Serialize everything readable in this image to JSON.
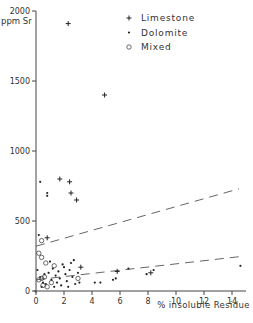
{
  "chart_data": {
    "type": "scatter",
    "title": "",
    "xlabel": "% insoluble Residue",
    "ylabel": "ppm Sr",
    "xlim": [
      0,
      15
    ],
    "ylim": [
      0,
      2000
    ],
    "x_ticks": [
      0,
      2,
      4,
      6,
      8,
      10,
      12,
      14
    ],
    "y_ticks": [
      0,
      500,
      1000,
      1500,
      2000
    ],
    "x_tick_labels": [
      "0",
      "2",
      "4",
      "6",
      "8",
      "10",
      "12",
      "14"
    ],
    "y_tick_labels": [
      "0",
      "500",
      "1000",
      "1500",
      "2000"
    ],
    "grid": false,
    "legend_position": "upper right",
    "legend": [
      "Limestone",
      "Dolomite",
      "Mixed"
    ],
    "series": [
      {
        "name": "Limestone",
        "marker": "plus",
        "points": [
          [
            2.3,
            1910
          ],
          [
            4.9,
            1400
          ],
          [
            1.7,
            800
          ],
          [
            2.4,
            780
          ],
          [
            2.5,
            700
          ],
          [
            2.9,
            650
          ],
          [
            0.8,
            380
          ],
          [
            5.8,
            140
          ],
          [
            8.2,
            130
          ],
          [
            3.2,
            170
          ]
        ]
      },
      {
        "name": "Dolomite",
        "marker": "dot",
        "points": [
          [
            0.3,
            780
          ],
          [
            0.8,
            700
          ],
          [
            0.8,
            680
          ],
          [
            0.2,
            400
          ],
          [
            0.1,
            150
          ],
          [
            0.3,
            100
          ],
          [
            0.5,
            60
          ],
          [
            0.7,
            50
          ],
          [
            0.9,
            130
          ],
          [
            1.1,
            80
          ],
          [
            1.2,
            160
          ],
          [
            1.4,
            110
          ],
          [
            1.5,
            60
          ],
          [
            1.6,
            140
          ],
          [
            1.7,
            90
          ],
          [
            1.8,
            40
          ],
          [
            2.0,
            170
          ],
          [
            2.1,
            120
          ],
          [
            2.2,
            70
          ],
          [
            2.4,
            150
          ],
          [
            2.5,
            200
          ],
          [
            2.6,
            100
          ],
          [
            2.8,
            50
          ],
          [
            3.0,
            130
          ],
          [
            3.1,
            60
          ],
          [
            1.0,
            210
          ],
          [
            1.3,
            30
          ],
          [
            2.3,
            30
          ],
          [
            4.2,
            60
          ],
          [
            4.6,
            60
          ],
          [
            5.5,
            80
          ],
          [
            5.7,
            90
          ],
          [
            6.6,
            160
          ],
          [
            7.9,
            120
          ],
          [
            8.4,
            150
          ],
          [
            14.6,
            180
          ],
          [
            0.4,
            30
          ],
          [
            0.6,
            120
          ],
          [
            1.9,
            190
          ],
          [
            2.7,
            220
          ]
        ]
      },
      {
        "name": "Mixed",
        "marker": "circle",
        "points": [
          [
            0.4,
            360
          ],
          [
            0.2,
            270
          ],
          [
            0.4,
            240
          ],
          [
            0.7,
            200
          ],
          [
            1.3,
            180
          ],
          [
            0.2,
            80
          ],
          [
            0.4,
            90
          ],
          [
            0.6,
            100
          ],
          [
            0.5,
            40
          ],
          [
            0.8,
            30
          ],
          [
            3.0,
            90
          ],
          [
            1.1,
            60
          ]
        ]
      }
    ],
    "trend_lines": [
      {
        "style": "dashed",
        "from": [
          0,
          320
        ],
        "to": [
          14.5,
          730
        ]
      },
      {
        "style": "dashed",
        "from": [
          0,
          80
        ],
        "to": [
          14.5,
          245
        ]
      }
    ]
  }
}
